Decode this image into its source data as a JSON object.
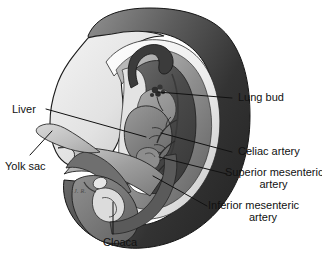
{
  "figure": {
    "type": "anatomical-illustration",
    "background_color": "#ffffff",
    "line_color": "#111111",
    "signature": "J. R."
  },
  "labels": {
    "lung_bud": "Lung bud",
    "celiac_artery": "Celiac artery",
    "superior_mesenteric_artery_line1": "Superior mesenteric",
    "superior_mesenteric_artery_line2": "artery",
    "inferior_mesenteric_artery_line1": "Inferior mesenteric",
    "inferior_mesenteric_artery_line2": "artery",
    "liver": "Liver",
    "yolk_sac": "Yolk sac",
    "cloaca": "Cloaca"
  },
  "palette": {
    "outer_dark": "#3a3a3a",
    "outer_mid": "#6e6e6e",
    "amnion_light": "#efefef",
    "body_light": "#d8d8d8",
    "body_pale": "#e8e8e8",
    "cavity_dark": "#4f4f4f",
    "gut_mid": "#8a8a8a",
    "liver_gray": "#7e7e7e",
    "heart_gray": "#9a9a9a",
    "yolk_gray": "#bdbdbd",
    "stroke": "#1a1a1a",
    "text": "#111111"
  }
}
